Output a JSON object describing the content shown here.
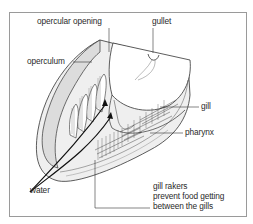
{
  "diagram": {
    "labels": {
      "opercular_opening": "opercular opening",
      "gullet": "gullet",
      "operculum": "operculum",
      "gill": "gill",
      "pharynx": "pharynx",
      "water": "water",
      "gill_rakers_line1": "gill rakers",
      "gill_rakers_line2": "prevent food getting",
      "gill_rakers_line3": "between the gills"
    },
    "colors": {
      "line": "#333333",
      "fill_light": "#e9e9e9",
      "fill_mid": "#d4d4d4",
      "frame": "#9a9a9a"
    }
  }
}
